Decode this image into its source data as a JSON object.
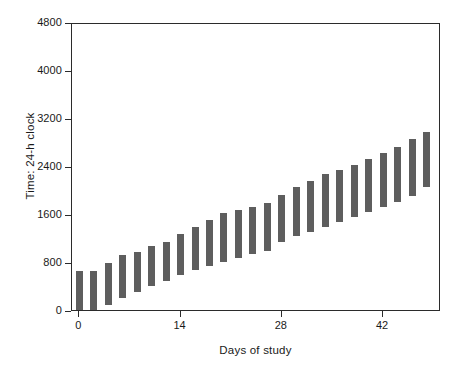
{
  "chart_data": {
    "type": "bar",
    "title": "",
    "subtitle": "",
    "xlabel": "Days of study",
    "ylabel": "Time: 24-h clock",
    "xlim": [
      -1,
      50
    ],
    "ylim": [
      0,
      4800
    ],
    "xticks": [
      0,
      14,
      28,
      42
    ],
    "xtick_labels": [
      "0",
      "14",
      "28",
      "42"
    ],
    "yticks": [
      0,
      800,
      1600,
      2400,
      3200,
      4000,
      4800
    ],
    "ytick_labels": [
      "0",
      "800",
      "1600",
      "2400",
      "3200",
      "4000",
      "4800"
    ],
    "grid": false,
    "legend": null,
    "bar_color": "#5e5e5e",
    "orientation": "vertical",
    "bar_style": "floating-range",
    "note": "Each bar is a floating range spanning sleep onset (bottom) to wake time (top) on a 24-h clock, plotted against day of study.",
    "categories": [
      0,
      2,
      4,
      6,
      8,
      10,
      12,
      14,
      16,
      18,
      20,
      22,
      24,
      26,
      28,
      30,
      32,
      34,
      36,
      38,
      40,
      42,
      44,
      46,
      48
    ],
    "series": [
      {
        "name": "Sleep period (24-h clock)",
        "bottoms": [
          0,
          30,
          120,
          230,
          340,
          440,
          520,
          620,
          700,
          770,
          830,
          900,
          960,
          1010,
          1160,
          1260,
          1340,
          1420,
          1500,
          1580,
          1660,
          1750,
          1840,
          1940,
          2080
        ],
        "tops": [
          680,
          690,
          820,
          950,
          1000,
          1100,
          1160,
          1300,
          1420,
          1540,
          1650,
          1700,
          1750,
          1810,
          1950,
          2080,
          2180,
          2300,
          2370,
          2450,
          2550,
          2650,
          2750,
          2880,
          3000
        ]
      }
    ]
  }
}
